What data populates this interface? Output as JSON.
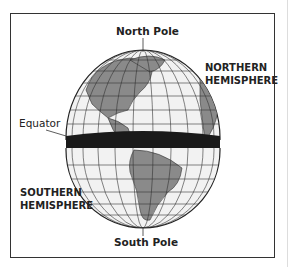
{
  "diagram": {
    "labels": {
      "north_pole": "North Pole",
      "south_pole": "South Pole",
      "equator": "Equator",
      "northern_hemisphere_line1": "NORTHERN",
      "northern_hemisphere_line2": "HEMISPHERE",
      "southern_hemisphere_line1": "SOUTHERN",
      "southern_hemisphere_line2": "HEMISPHERE"
    },
    "colors": {
      "ocean": "#f2f2f2",
      "land": "#8a8a8a",
      "grid": "#333333",
      "equator_band": "#1a1a1a",
      "frame": "#333333"
    }
  }
}
